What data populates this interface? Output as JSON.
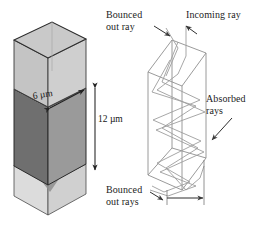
{
  "figure": {
    "background_color": "#ffffff",
    "panels": [
      {
        "name": "shaded-cuboid",
        "description": "Shaded 3D rectangular pillar with dimension annotations"
      },
      {
        "name": "ray-diagram",
        "description": "Wireframe rectangular pillar showing internal bouncing light rays"
      }
    ]
  },
  "dimensions": {
    "width_label": "6 µm",
    "height_label": "12 µm"
  },
  "annotations": {
    "bounced_out_ray": "Bounced\nout ray",
    "incoming_ray": "Incoming ray",
    "absorbed_rays": "Absorbed\nrays",
    "bounced_out_rays": "Bounced\nout rays"
  },
  "colors": {
    "outline": "#2b2b2b",
    "face_left_dark": "#6f6f6f",
    "face_front_mid": "#9a9a9a",
    "face_top_light": "#c9c9c9",
    "face_glass_light": "#d2d2d2",
    "face_glass_pale": "#dcdcdc",
    "wireframe": "#8c8c8c",
    "ray_line": "#9b9b9b",
    "arrow": "#3a3a3a",
    "text": "#1d1d1d"
  },
  "icons": {
    "dimension_arrow_double": "double-headed-arrow",
    "pointer_arrow": "leader-arrow"
  }
}
